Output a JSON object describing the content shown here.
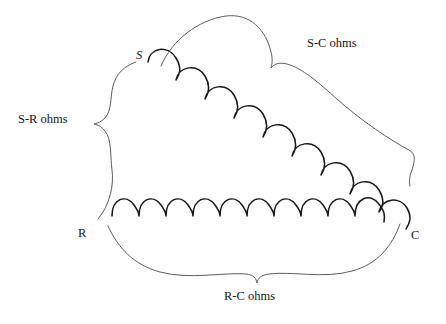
{
  "figure": {
    "background_color": "#ffffff",
    "coil_color": "#17171c",
    "brace_color": "#4a4a52",
    "text_color": "#161616"
  },
  "nodes": [
    {
      "id": "S",
      "label": "S",
      "x": 140,
      "y": 56
    },
    {
      "id": "R",
      "label": "R",
      "x": 82,
      "y": 234
    },
    {
      "id": "C",
      "label": "C",
      "x": 415,
      "y": 236
    }
  ],
  "resistors": [
    {
      "id": "s-c-coil",
      "name": "diagonal-coil-s-to-c",
      "from": "S",
      "to": "C",
      "loops": 9,
      "orientation": "diagonal-descending"
    },
    {
      "id": "r-c-coil",
      "name": "horizontal-coil-r-to-c",
      "from": "R",
      "to": "C",
      "loops": 9,
      "orientation": "horizontal"
    }
  ],
  "braces": [
    {
      "id": "s-r-brace",
      "label": "S-R ohms",
      "label_x": 18,
      "label_y": 113,
      "orientation": "vertical-left",
      "spans": [
        "S",
        "R"
      ]
    },
    {
      "id": "s-c-brace",
      "label": "S-C ohms",
      "label_x": 307,
      "label_y": 37,
      "orientation": "horizontal-top",
      "spans": [
        "S",
        "C"
      ]
    },
    {
      "id": "r-c-brace",
      "label": "R-C ohms",
      "label_x": 224,
      "label_y": 290,
      "orientation": "horizontal-bottom",
      "spans": [
        "R",
        "C"
      ]
    }
  ]
}
